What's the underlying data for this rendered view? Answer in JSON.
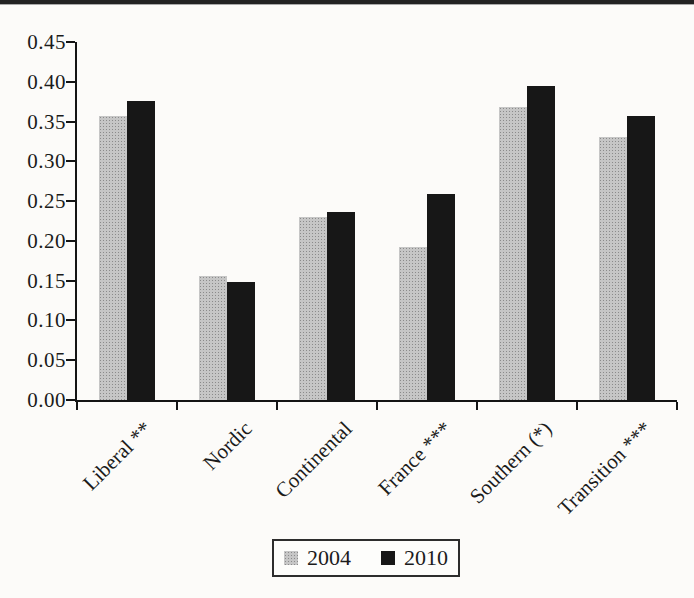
{
  "chart_data": {
    "type": "bar",
    "title": "",
    "xlabel": "",
    "ylabel": "",
    "categories": [
      "Liberal **",
      "Nordic",
      "Continental",
      "France ***",
      "Southern (*)",
      "Transition ***"
    ],
    "series": [
      {
        "name": "2004",
        "color": "#b4b4b4",
        "pattern": "halftone-gray",
        "values": [
          0.357,
          0.156,
          0.23,
          0.192,
          0.368,
          0.33
        ]
      },
      {
        "name": "2010",
        "color": "#171717",
        "pattern": "solid-black",
        "values": [
          0.376,
          0.148,
          0.236,
          0.259,
          0.395,
          0.357
        ]
      }
    ],
    "ylim": [
      0,
      0.45
    ],
    "ytick_step": 0.05,
    "yticks": [
      "0.45",
      "0.40",
      "0.35",
      "0.30",
      "0.25",
      "0.20",
      "0.15",
      "0.10",
      "0.05",
      "0.00"
    ],
    "grid": false,
    "legend_position": "bottom-center",
    "x_label_rotation_deg": 45
  },
  "page": {
    "axis_color": "#141414",
    "background": "#fcfbf9",
    "top_rule_color": "#232323"
  }
}
